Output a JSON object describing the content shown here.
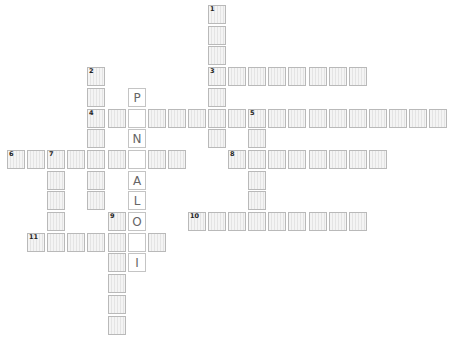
{
  "puzzle": {
    "type": "crossword",
    "colors": {
      "cell_bg": "#f1f1f1",
      "cell_border": "#b9b9b9",
      "hint_bg": "#ffffff",
      "letter": "#666666"
    },
    "words": [
      {
        "number": "1",
        "direction": "down",
        "col": 10,
        "row": 0,
        "length": 7
      },
      {
        "number": "2",
        "direction": "down",
        "col": 4,
        "row": 3,
        "length": 7
      },
      {
        "number": "3",
        "direction": "across",
        "col": 10,
        "row": 3,
        "length": 8
      },
      {
        "number": "4",
        "direction": "across",
        "col": 4,
        "row": 5,
        "length": 18
      },
      {
        "number": "5",
        "direction": "down",
        "col": 12,
        "row": 5,
        "length": 6
      },
      {
        "number": "6",
        "direction": "across",
        "col": 0,
        "row": 7,
        "length": 9
      },
      {
        "number": "7",
        "direction": "down",
        "col": 2,
        "row": 7,
        "length": 5
      },
      {
        "number": "8",
        "direction": "across",
        "col": 11,
        "row": 7,
        "length": 8
      },
      {
        "number": "9",
        "direction": "down",
        "col": 5,
        "row": 10,
        "length": 6
      },
      {
        "number": "10",
        "direction": "across",
        "col": 9,
        "row": 10,
        "length": 9
      },
      {
        "number": "11",
        "direction": "across",
        "col": 1,
        "row": 11,
        "length": 7
      }
    ],
    "hint_column": {
      "col": 6,
      "start_row": 4,
      "letters": [
        "P",
        "",
        "N",
        "",
        "A",
        "L",
        "O",
        "",
        "I"
      ]
    }
  }
}
